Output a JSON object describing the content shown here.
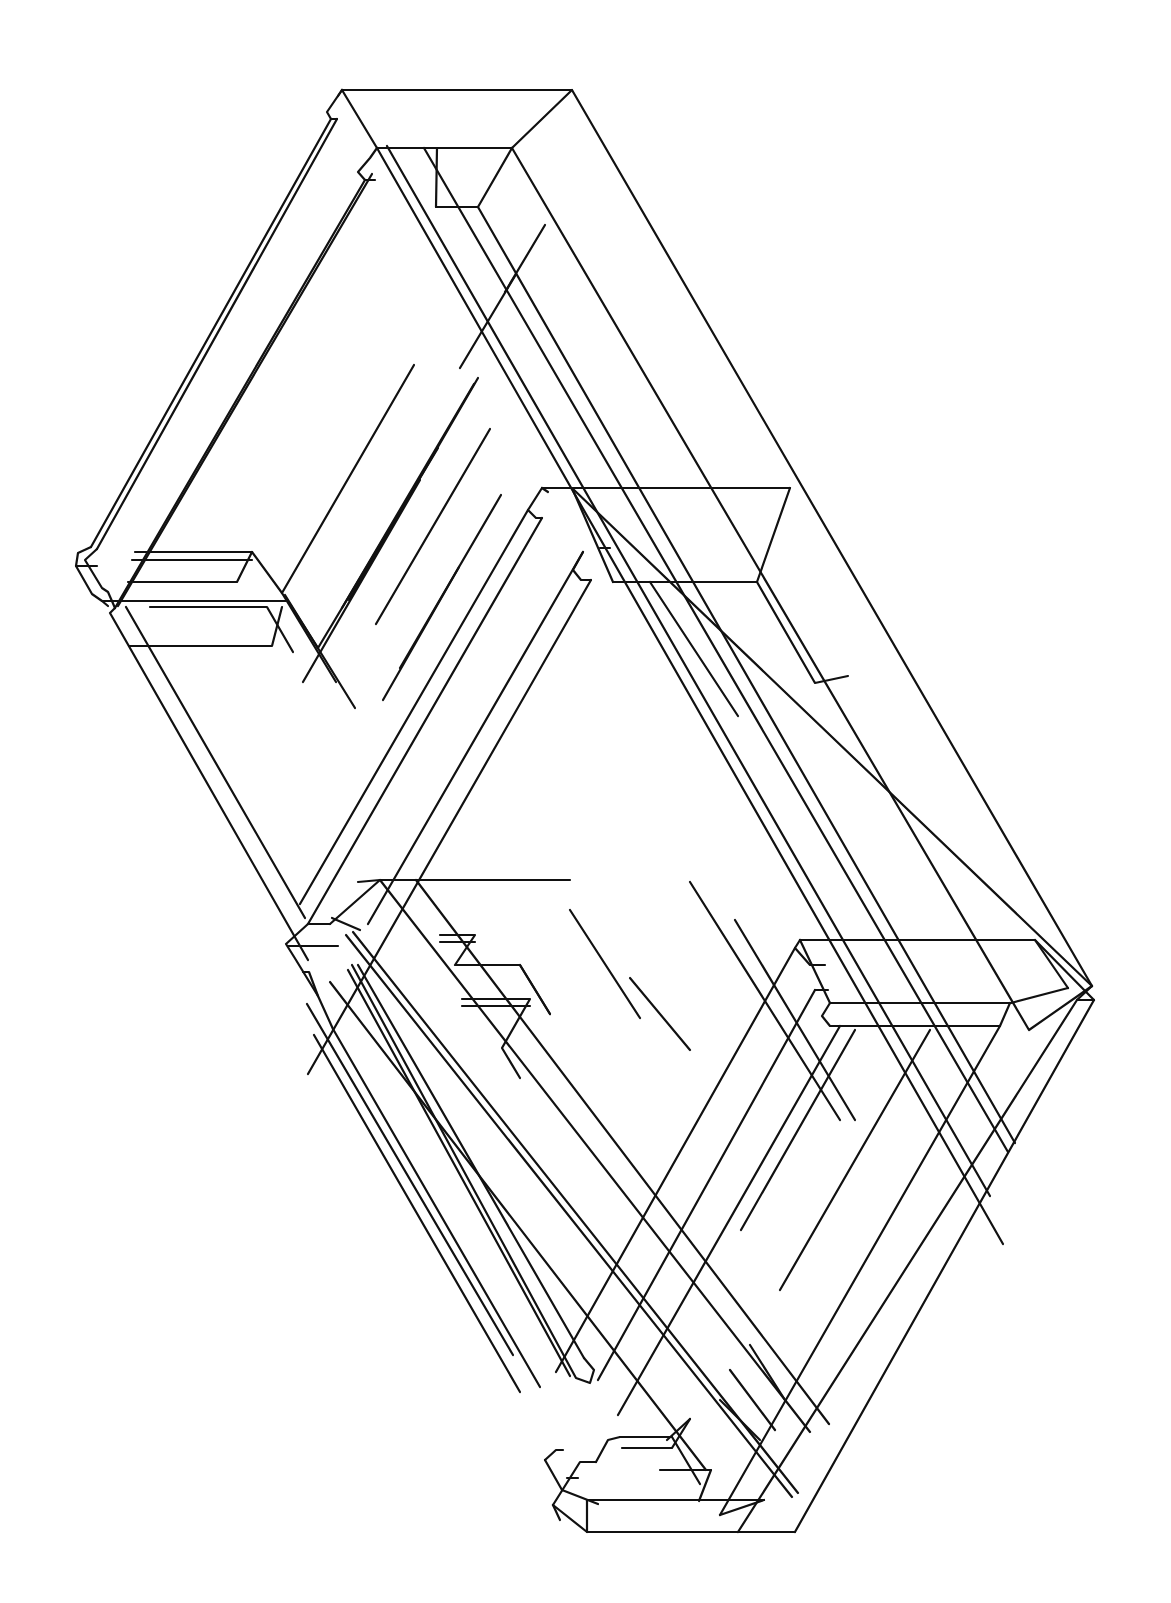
{
  "figure": {
    "title": "",
    "stroke_color": "#111111",
    "background_color": "#ffffff"
  },
  "drawing": {
    "polylines": [
      [
        [
          342,
          90
        ],
        [
          572,
          90
        ],
        [
          1092,
          986
        ]
      ],
      [
        [
          342,
          90
        ],
        [
          377,
          148
        ],
        [
          512,
          148
        ],
        [
          572,
          90
        ]
      ],
      [
        [
          512,
          148
        ],
        [
          1029,
          1030
        ],
        [
          1092,
          986
        ]
      ],
      [
        [
          342,
          90
        ],
        [
          327,
          112
        ],
        [
          331,
          119
        ],
        [
          337,
          119
        ]
      ],
      [
        [
          342,
          90
        ],
        [
          338,
          96
        ]
      ],
      [
        [
          377,
          148
        ],
        [
          370,
          158
        ],
        [
          358,
          172
        ],
        [
          365,
          180
        ],
        [
          375,
          180
        ]
      ],
      [
        [
          377,
          148
        ],
        [
          1003,
          1244
        ]
      ],
      [
        [
          387,
          146
        ],
        [
          990,
          1196
        ]
      ],
      [
        [
          424,
          148
        ],
        [
          1008,
          1152
        ]
      ],
      [
        [
          512,
          148
        ],
        [
          478,
          207
        ]
      ],
      [
        [
          478,
          207
        ],
        [
          1015,
          1143
        ]
      ],
      [
        [
          436,
          207
        ],
        [
          478,
          207
        ]
      ],
      [
        [
          437,
          148
        ],
        [
          436,
          207
        ]
      ],
      [
        [
          331,
          119
        ],
        [
          91,
          547
        ]
      ],
      [
        [
          337,
          119
        ],
        [
          97,
          549
        ]
      ],
      [
        [
          365,
          180
        ],
        [
          115,
          608
        ]
      ],
      [
        [
          372,
          174
        ],
        [
          118,
          606
        ]
      ],
      [
        [
          91,
          547
        ],
        [
          78,
          553
        ],
        [
          76,
          566
        ],
        [
          92,
          594
        ],
        [
          102,
          601
        ],
        [
          108,
          606
        ]
      ],
      [
        [
          97,
          549
        ],
        [
          85,
          560
        ],
        [
          102,
          588
        ],
        [
          108,
          592
        ],
        [
          115,
          608
        ]
      ],
      [
        [
          135,
          552
        ],
        [
          252,
          552
        ],
        [
          282,
          593
        ],
        [
          336,
          682
        ]
      ],
      [
        [
          132,
          560
        ],
        [
          252,
          560
        ]
      ],
      [
        [
          128,
          582
        ],
        [
          237,
          582
        ],
        [
          252,
          552
        ]
      ],
      [
        [
          76,
          566
        ],
        [
          97,
          566
        ]
      ],
      [
        [
          102,
          601
        ],
        [
          288,
          601
        ],
        [
          318,
          648
        ]
      ],
      [
        [
          150,
          607
        ],
        [
          267,
          607
        ],
        [
          293,
          652
        ]
      ],
      [
        [
          129,
          646
        ],
        [
          272,
          646
        ],
        [
          282,
          607
        ]
      ],
      [
        [
          115,
          608
        ],
        [
          110,
          613
        ],
        [
          308,
          960
        ]
      ],
      [
        [
          126,
          607
        ],
        [
          305,
          918
        ]
      ],
      [
        [
          285,
          595
        ],
        [
          355,
          708
        ]
      ],
      [
        [
          303,
          682
        ],
        [
          420,
          480
        ]
      ],
      [
        [
          318,
          648
        ],
        [
          438,
          448
        ]
      ],
      [
        [
          342,
          608
        ],
        [
          474,
          384
        ]
      ],
      [
        [
          349,
          600
        ],
        [
          478,
          378
        ]
      ],
      [
        [
          383,
          700
        ],
        [
          459,
          567
        ]
      ],
      [
        [
          282,
          593
        ],
        [
          414,
          365
        ]
      ],
      [
        [
          376,
          624
        ],
        [
          490,
          429
        ]
      ],
      [
        [
          400,
          668
        ],
        [
          501,
          495
        ]
      ],
      [
        [
          505,
          292
        ],
        [
          545,
          225
        ]
      ],
      [
        [
          460,
          368
        ],
        [
          515,
          276
        ]
      ],
      [
        [
          542,
          488
        ],
        [
          572,
          488
        ],
        [
          1092,
          986
        ]
      ],
      [
        [
          542,
          488
        ],
        [
          528,
          510
        ],
        [
          536,
          518
        ],
        [
          542,
          518
        ]
      ],
      [
        [
          542,
          488
        ],
        [
          548,
          492
        ]
      ],
      [
        [
          542,
          488
        ],
        [
          572,
          488
        ],
        [
          613,
          582
        ]
      ],
      [
        [
          572,
          488
        ],
        [
          790,
          488
        ]
      ],
      [
        [
          613,
          582
        ],
        [
          757,
          582
        ],
        [
          790,
          488
        ]
      ],
      [
        [
          600,
          548
        ],
        [
          610,
          548
        ]
      ],
      [
        [
          583,
          552
        ],
        [
          573,
          570
        ],
        [
          581,
          580
        ],
        [
          591,
          580
        ]
      ],
      [
        [
          591,
          580
        ],
        [
          308,
          1074
        ]
      ],
      [
        [
          542,
          518
        ],
        [
          308,
          924
        ]
      ],
      [
        [
          528,
          510
        ],
        [
          300,
          904
        ]
      ],
      [
        [
          583,
          552
        ],
        [
          368,
          924
        ]
      ],
      [
        [
          650,
          582
        ],
        [
          738,
          716
        ]
      ],
      [
        [
          757,
          582
        ],
        [
          815,
          683
        ],
        [
          848,
          676
        ]
      ],
      [
        [
          308,
          924
        ],
        [
          286,
          944
        ],
        [
          296,
          960
        ],
        [
          318,
          996
        ],
        [
          333,
          1029
        ]
      ],
      [
        [
          308,
          924
        ],
        [
          330,
          924
        ]
      ],
      [
        [
          288,
          946
        ],
        [
          338,
          946
        ]
      ],
      [
        [
          330,
          924
        ],
        [
          380,
          880
        ],
        [
          570,
          880
        ]
      ],
      [
        [
          360,
          930
        ],
        [
          332,
          918
        ]
      ],
      [
        [
          380,
          880
        ],
        [
          810,
          1432
        ]
      ],
      [
        [
          416,
          880
        ],
        [
          829,
          1424
        ]
      ],
      [
        [
          358,
          882
        ],
        [
          380,
          880
        ]
      ],
      [
        [
          346,
          935
        ],
        [
          792,
          1497
        ]
      ],
      [
        [
          353,
          932
        ],
        [
          798,
          1493
        ]
      ],
      [
        [
          330,
          982
        ],
        [
          706,
          1470
        ]
      ],
      [
        [
          303,
          972
        ],
        [
          309,
          972
        ],
        [
          318,
          996
        ]
      ],
      [
        [
          333,
          1029
        ],
        [
          540,
          1387
        ]
      ],
      [
        [
          314,
          1035
        ],
        [
          520,
          1392
        ]
      ],
      [
        [
          307,
          1004
        ],
        [
          513,
          1355
        ]
      ],
      [
        [
          348,
          970
        ],
        [
          570,
          1376
        ]
      ],
      [
        [
          352,
          965
        ],
        [
          576,
          1378
        ],
        [
          590,
          1383
        ],
        [
          594,
          1370
        ],
        [
          584,
          1358
        ]
      ],
      [
        [
          358,
          965
        ],
        [
          584,
          1358
        ]
      ],
      [
        [
          440,
          935
        ],
        [
          475,
          935
        ],
        [
          455,
          965
        ],
        [
          520,
          965
        ],
        [
          550,
          1014
        ]
      ],
      [
        [
          440,
          942
        ],
        [
          475,
          942
        ]
      ],
      [
        [
          462,
          999
        ],
        [
          530,
          999
        ],
        [
          502,
          1048
        ],
        [
          520,
          1078
        ]
      ],
      [
        [
          462,
          1006
        ],
        [
          530,
          1006
        ]
      ],
      [
        [
          520,
          965
        ],
        [
          550,
          1014
        ]
      ],
      [
        [
          570,
          910
        ],
        [
          640,
          1018
        ]
      ],
      [
        [
          630,
          978
        ],
        [
          690,
          1050
        ]
      ],
      [
        [
          690,
          882
        ],
        [
          840,
          1120
        ]
      ],
      [
        [
          735,
          920
        ],
        [
          855,
          1120
        ]
      ],
      [
        [
          800,
          940
        ],
        [
          1035,
          940
        ],
        [
          1094,
          1000
        ]
      ],
      [
        [
          1035,
          940
        ],
        [
          1068,
          988
        ]
      ],
      [
        [
          800,
          940
        ],
        [
          795,
          948
        ],
        [
          810,
          965
        ],
        [
          825,
          965
        ]
      ],
      [
        [
          800,
          940
        ],
        [
          830,
          1003
        ]
      ],
      [
        [
          830,
          1003
        ],
        [
          1011,
          1003
        ],
        [
          1068,
          988
        ]
      ],
      [
        [
          815,
          990
        ],
        [
          828,
          990
        ]
      ],
      [
        [
          830,
          1003
        ],
        [
          822,
          1016
        ],
        [
          830,
          1026
        ],
        [
          840,
          1026
        ]
      ],
      [
        [
          840,
          1026
        ],
        [
          1000,
          1026
        ],
        [
          1010,
          1003
        ]
      ],
      [
        [
          1092,
          986
        ],
        [
          1077,
          1000
        ],
        [
          1094,
          1000
        ]
      ],
      [
        [
          1094,
          1000
        ],
        [
          795,
          1532
        ]
      ],
      [
        [
          1077,
          1000
        ],
        [
          738,
          1532
        ]
      ],
      [
        [
          1000,
          1026
        ],
        [
          720,
          1515
        ]
      ],
      [
        [
          930,
          1030
        ],
        [
          780,
          1290
        ]
      ],
      [
        [
          855,
          1030
        ],
        [
          741,
          1230
        ]
      ],
      [
        [
          840,
          1026
        ],
        [
          618,
          1415
        ]
      ],
      [
        [
          815,
          990
        ],
        [
          598,
          1380
        ]
      ],
      [
        [
          795,
          948
        ],
        [
          556,
          1372
        ]
      ],
      [
        [
          738,
          1532
        ],
        [
          587,
          1532
        ],
        [
          587,
          1500
        ],
        [
          764,
          1500
        ]
      ],
      [
        [
          587,
          1532
        ],
        [
          553,
          1505
        ]
      ],
      [
        [
          553,
          1505
        ],
        [
          580,
          1462
        ],
        [
          596,
          1462
        ]
      ],
      [
        [
          553,
          1505
        ],
        [
          560,
          1520
        ]
      ],
      [
        [
          567,
          1478
        ],
        [
          578,
          1478
        ]
      ],
      [
        [
          545,
          1460
        ],
        [
          556,
          1450
        ],
        [
          563,
          1450
        ]
      ],
      [
        [
          545,
          1460
        ],
        [
          562,
          1490
        ],
        [
          598,
          1504
        ]
      ],
      [
        [
          596,
          1462
        ],
        [
          608,
          1440
        ],
        [
          620,
          1437
        ]
      ],
      [
        [
          620,
          1437
        ],
        [
          672,
          1437
        ]
      ],
      [
        [
          622,
          1448
        ],
        [
          672,
          1448
        ],
        [
          690,
          1419
        ]
      ],
      [
        [
          667,
          1440
        ],
        [
          690,
          1419
        ]
      ],
      [
        [
          660,
          1470
        ],
        [
          711,
          1470
        ],
        [
          699,
          1501
        ]
      ],
      [
        [
          672,
          1437
        ],
        [
          700,
          1484
        ]
      ],
      [
        [
          720,
          1515
        ],
        [
          764,
          1500
        ]
      ],
      [
        [
          738,
          1532
        ],
        [
          795,
          1532
        ]
      ],
      [
        [
          706,
          1470
        ],
        [
          711,
          1470
        ]
      ],
      [
        [
          720,
          1400
        ],
        [
          760,
          1440
        ]
      ],
      [
        [
          730,
          1370
        ],
        [
          775,
          1430
        ]
      ],
      [
        [
          750,
          1345
        ],
        [
          785,
          1400
        ]
      ]
    ]
  }
}
